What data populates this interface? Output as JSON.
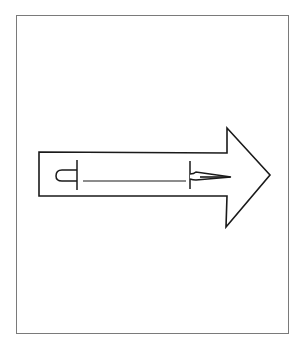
{
  "figure": {
    "frame_color": "#7a7a7a",
    "stroke_color": "#1a1a1a",
    "background_color": "#ffffff"
  },
  "arrow": {
    "direction": "right",
    "shaft": {
      "x1": 39,
      "y1": 152,
      "x2": 227,
      "y2": 196
    },
    "head": {
      "base_x": 227,
      "top_y": 128,
      "bottom_y": 227,
      "tip_x": 270,
      "tip_y": 175
    }
  },
  "inner_object": {
    "type": "dart-like line drawing",
    "left_cap": "rounded-rectangle",
    "right_point": "tapered-needle"
  }
}
